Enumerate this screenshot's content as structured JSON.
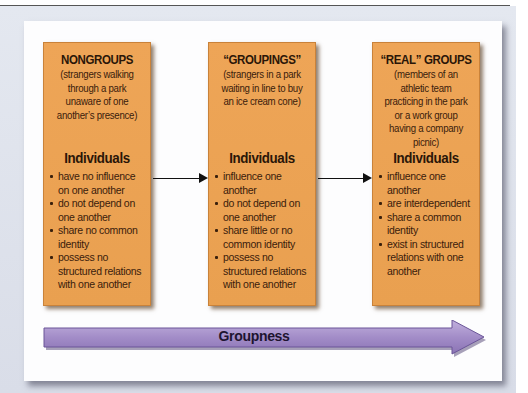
{
  "diagram": {
    "colors": {
      "box_fill": "#eea557",
      "box_border": "#c9823a",
      "text": "#2a1608",
      "arrow_fill": "#a58fc9",
      "arrow_edge": "#6a5598",
      "panel": "#fdfdfe",
      "frame": "#dde1ea"
    },
    "stages": [
      {
        "title": "NONGROUPS",
        "description": "(strangers walking through a park unaware of one another’s presence)",
        "subheading": "Individuals",
        "traits": [
          "have no influence on one another",
          "do not depend on one another",
          "share no common identity",
          "possess no structured relations with one another"
        ]
      },
      {
        "title": "“GROUPINGS”",
        "description": "(strangers in a park waiting in line to buy an ice cream cone)",
        "subheading": "Individuals",
        "traits": [
          "influence one another",
          "do not depend on one another",
          "share little or no common identity",
          "possess no structured relations with one another"
        ]
      },
      {
        "title": "“REAL” GROUPS",
        "description": "(members of an athletic team practicing in the park or a work group having a company picnic)",
        "subheading": "Individuals",
        "traits": [
          "influence one another",
          "are interdependent",
          "share a common identity",
          "exist in structured relations with one another"
        ]
      }
    ],
    "connectors": [
      {
        "from": "NONGROUPS",
        "to": "“GROUPINGS”",
        "icon": "arrow-right-icon"
      },
      {
        "from": "“GROUPINGS”",
        "to": "“REAL” GROUPS",
        "icon": "arrow-right-icon"
      }
    ],
    "axis": {
      "label": "Groupness",
      "icon": "big-arrow-right-icon"
    }
  }
}
